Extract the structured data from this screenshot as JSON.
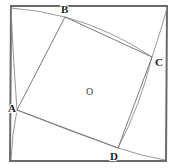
{
  "figure": {
    "canvas": {
      "width": 174,
      "height": 168,
      "background": "#ffffff"
    },
    "colors": {
      "outer_square_stroke": "#6b6b6b",
      "inner_quad_stroke": "#7a7a7a",
      "arc_stroke": "#8c8c8c",
      "label_text": "#242424",
      "center_label_text": "#3a3a3a"
    },
    "outer_square": {
      "name": "outer-square",
      "points": "11,6 167,6 166,161 10,161",
      "stroke_width": 2
    },
    "inner_quad": {
      "name": "inner-quadrilateral",
      "points": "17,110 65,17 152,57 118,148",
      "stroke_width": 1
    },
    "arcs": [
      {
        "id": "arc-corner-topleft-to-B",
        "d": "M 11,8 Q 38,10 65,17"
      },
      {
        "id": "arc-B-to-C",
        "d": "M 65,17 Q 112,30 152,57"
      },
      {
        "id": "arc-corner-topright-to-C",
        "d": "M 167,8 Q 161,30 152,57"
      },
      {
        "id": "arc-C-to-D",
        "d": "M 152,57 Q 140,106 118,148"
      },
      {
        "id": "arc-D-to-corner-bottomright",
        "d": "M 118,148 Q 142,156 165,160"
      },
      {
        "id": "arc-corner-bottomleft-to-A",
        "d": "M 11,160 Q 12,134 17,110"
      },
      {
        "id": "arc-A-to-D",
        "d": "M 17,110 Q 67,130 118,148"
      },
      {
        "id": "arc-A-to-corner-topleft",
        "d": "M 17,110 Q 13,57 11,8"
      }
    ],
    "vertices": [
      {
        "id": "vertex-A",
        "label": "A",
        "x": 17,
        "y": 110,
        "label_x": 8,
        "label_y": 112
      },
      {
        "id": "vertex-B",
        "label": "B",
        "x": 65,
        "y": 17,
        "label_x": 61,
        "label_y": 13
      },
      {
        "id": "vertex-C",
        "label": "C",
        "x": 152,
        "y": 57,
        "label_x": 155,
        "label_y": 66
      },
      {
        "id": "vertex-D",
        "label": "D",
        "x": 118,
        "y": 148,
        "label_x": 110,
        "label_y": 160
      }
    ],
    "center": {
      "id": "center-point-O",
      "label": "O",
      "label_x": 86,
      "label_y": 95
    }
  }
}
